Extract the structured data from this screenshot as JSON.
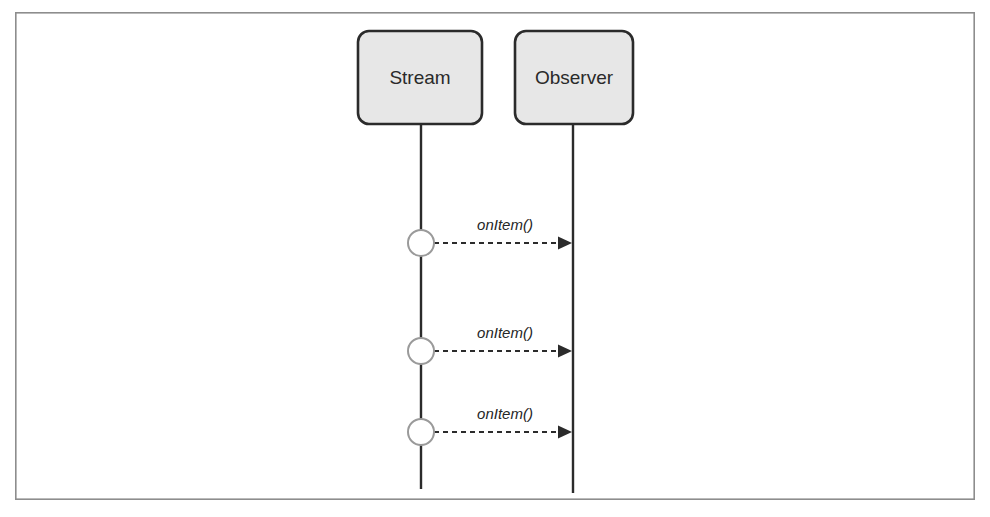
{
  "diagram": {
    "type": "uml-sequence-diagram",
    "title": "",
    "background_color": "#ffffff",
    "frame": {
      "x": 15,
      "y": 12,
      "width": 960,
      "height": 488,
      "stroke_color": "#8d8d8d",
      "fill_color": "#ffffff"
    },
    "participants": [
      {
        "id": "stream",
        "label": "Stream",
        "box": {
          "x": 358,
          "y": 31,
          "width": 124,
          "height": 93,
          "rx": 11
        },
        "fill_color": "#e7e7e7",
        "stroke_color": "#2b2b2b",
        "text_color": "#2a2a2a",
        "lifeline_x": 421,
        "lifeline_top": 124,
        "lifeline_bottom": 489
      },
      {
        "id": "observer",
        "label": "Observer",
        "box": {
          "x": 515,
          "y": 31,
          "width": 118,
          "height": 93,
          "rx": 11
        },
        "fill_color": "#e7e7e7",
        "stroke_color": "#2b2b2b",
        "text_color": "#2a2a2a",
        "lifeline_x": 573,
        "lifeline_top": 124,
        "lifeline_bottom": 493
      }
    ],
    "events": [
      {
        "id": "event-1",
        "lifeline": "stream",
        "cx": 421,
        "cy": 243,
        "r": 13,
        "fill_color": "#ffffff",
        "stroke_color": "#9a9a9a"
      },
      {
        "id": "event-2",
        "lifeline": "stream",
        "cx": 421,
        "cy": 351,
        "r": 13,
        "fill_color": "#ffffff",
        "stroke_color": "#9a9a9a"
      },
      {
        "id": "event-3",
        "lifeline": "stream",
        "cx": 421,
        "cy": 432,
        "r": 13,
        "fill_color": "#ffffff",
        "stroke_color": "#9a9a9a"
      }
    ],
    "messages": [
      {
        "id": "message-1",
        "label": "onItem()",
        "from": "stream",
        "to": "observer",
        "x1": 434,
        "x2": 572,
        "y": 243,
        "label_x": 505,
        "label_y": 230,
        "style": "dashed",
        "arrow": "filled-triangle",
        "stroke_color": "#2b2b2b"
      },
      {
        "id": "message-2",
        "label": "onItem()",
        "from": "stream",
        "to": "observer",
        "x1": 434,
        "x2": 572,
        "y": 351,
        "label_x": 505,
        "label_y": 338,
        "style": "dashed",
        "arrow": "filled-triangle",
        "stroke_color": "#2b2b2b"
      },
      {
        "id": "message-3",
        "label": "onItem()",
        "from": "stream",
        "to": "observer",
        "x1": 434,
        "x2": 572,
        "y": 432,
        "label_x": 505,
        "label_y": 419,
        "style": "dashed",
        "arrow": "filled-triangle",
        "stroke_color": "#2b2b2b"
      }
    ]
  }
}
